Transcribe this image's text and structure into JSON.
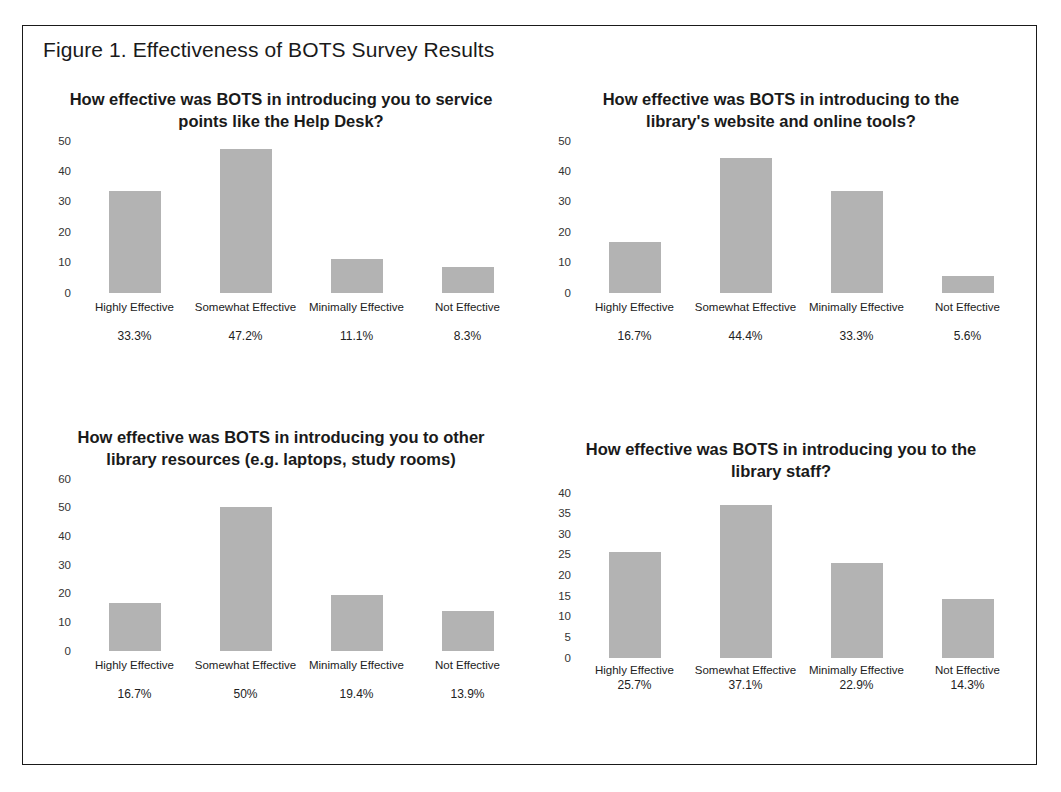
{
  "figure": {
    "caption": "Figure 1. Effectiveness of BOTS Survey Results"
  },
  "chart_data": [
    {
      "type": "bar",
      "title": "How effective was BOTS in introducing you to service points like the Help Desk?",
      "categories": [
        "Highly Effective",
        "Somewhat Effective",
        "Minimally Effective",
        "Not Effective"
      ],
      "values": [
        33.3,
        47.2,
        11.1,
        8.3
      ],
      "data_labels": [
        "33.3%",
        "47.2%",
        "11.1%",
        "8.3%"
      ],
      "yticks": [
        50,
        40,
        30,
        20,
        10,
        0
      ],
      "ylim": [
        0,
        50
      ],
      "xlabel": "",
      "ylabel": "",
      "grid": false,
      "legend": "none",
      "bar_color": "#b3b3b3"
    },
    {
      "type": "bar",
      "title": "How effective was BOTS in introducing to the library's website and online tools?",
      "categories": [
        "Highly Effective",
        "Somewhat Effective",
        "Minimally Effective",
        "Not Effective"
      ],
      "values": [
        16.7,
        44.4,
        33.3,
        5.6
      ],
      "data_labels": [
        "16.7%",
        "44.4%",
        "33.3%",
        "5.6%"
      ],
      "yticks": [
        50,
        40,
        30,
        20,
        10,
        0
      ],
      "ylim": [
        0,
        50
      ],
      "xlabel": "",
      "ylabel": "",
      "grid": false,
      "legend": "none",
      "bar_color": "#b3b3b3"
    },
    {
      "type": "bar",
      "title": "How effective was BOTS in introducing you to other library resources (e.g. laptops, study rooms)",
      "categories": [
        "Highly Effective",
        "Somewhat Effective",
        "Minimally Effective",
        "Not Effective"
      ],
      "values": [
        16.7,
        50,
        19.4,
        13.9
      ],
      "data_labels": [
        "16.7%",
        "50%",
        "19.4%",
        "13.9%"
      ],
      "yticks": [
        60,
        50,
        40,
        30,
        20,
        10,
        0
      ],
      "ylim": [
        0,
        60
      ],
      "xlabel": "",
      "ylabel": "",
      "grid": false,
      "legend": "none",
      "bar_color": "#b3b3b3"
    },
    {
      "type": "bar",
      "title": "How effective was BOTS in introducing you to the library staff?",
      "categories": [
        "Highly Effective",
        "Somewhat Effective",
        "Minimally Effective",
        "Not Effective"
      ],
      "values": [
        25.7,
        37.1,
        22.9,
        14.3
      ],
      "data_labels": [
        "25.7%",
        "37.1%",
        "22.9%",
        "14.3%"
      ],
      "yticks": [
        40,
        35,
        30,
        25,
        20,
        15,
        10,
        5,
        0
      ],
      "ylim": [
        0,
        40
      ],
      "xlabel": "",
      "ylabel": "",
      "grid": false,
      "legend": "none",
      "bar_color": "#b3b3b3"
    }
  ]
}
